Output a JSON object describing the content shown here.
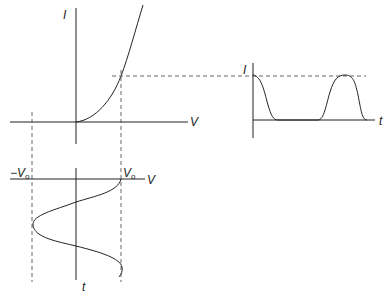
{
  "diagram": {
    "title": "",
    "iv_plot": {
      "y_label": "I",
      "x_label": "V"
    },
    "current_time_plot": {
      "y_label": "I",
      "x_label": "t"
    },
    "voltage_time_plot": {
      "left_marker": "−V",
      "left_marker_sub": "o",
      "right_marker": "V",
      "right_marker_sub": "o",
      "x_label": "V",
      "y_label": "t"
    },
    "colors": {
      "line": "#222222",
      "dashed": "#555555",
      "background": "#ffffff"
    }
  }
}
